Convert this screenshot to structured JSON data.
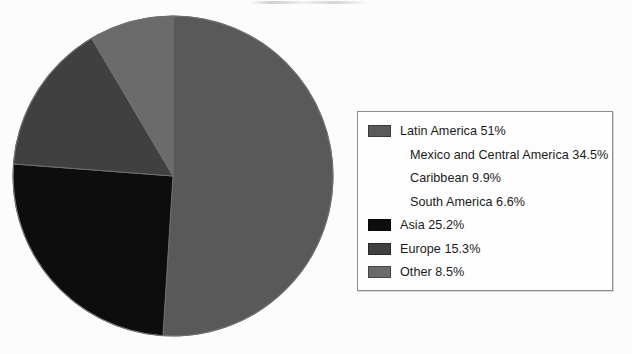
{
  "chart_data": {
    "type": "pie",
    "title": "",
    "subtitle": "",
    "xlabel": "",
    "ylabel": "",
    "legend_position": "right",
    "grid": false,
    "start_angle_deg": 0,
    "direction": "clockwise",
    "categories": [
      "Latin America",
      "Asia",
      "Europe",
      "Other"
    ],
    "values": [
      51,
      25.2,
      15.3,
      8.5
    ],
    "value_unit": "%",
    "colors": [
      "#595959",
      "#0d0d0d",
      "#404040",
      "#6b6b6b"
    ],
    "slices": [
      {
        "label": "Latin America",
        "value": 51,
        "display": "51%",
        "color": "#595959"
      },
      {
        "label": "Asia",
        "value": 25.2,
        "display": "25.2%",
        "color": "#0d0d0d"
      },
      {
        "label": "Europe",
        "value": 15.3,
        "display": "15.3%",
        "color": "#404040"
      },
      {
        "label": "Other",
        "value": 8.5,
        "display": "8.5%",
        "color": "#6b6b6b"
      }
    ],
    "subcategories": [
      {
        "parent": "Latin America",
        "label": "Mexico and Central America",
        "value": 34.5,
        "display": "34.5%"
      },
      {
        "parent": "Latin America",
        "label": "Caribbean",
        "value": 9.9,
        "display": "9.9%"
      },
      {
        "parent": "Latin America",
        "label": "South America",
        "value": 6.6,
        "display": "6.6%"
      }
    ],
    "annotations": []
  },
  "legend": {
    "rows": [
      {
        "text": "Latin America 51%",
        "swatch": "#595959",
        "has_swatch": true,
        "indent": false
      },
      {
        "text": "Mexico and Central America 34.5%",
        "swatch": "",
        "has_swatch": false,
        "indent": true
      },
      {
        "text": "Caribbean 9.9%",
        "swatch": "",
        "has_swatch": false,
        "indent": true
      },
      {
        "text": "South America 6.6%",
        "swatch": "",
        "has_swatch": false,
        "indent": true
      },
      {
        "text": "Asia 25.2%",
        "swatch": "#0d0d0d",
        "has_swatch": true,
        "indent": false
      },
      {
        "text": "Europe 15.3%",
        "swatch": "#404040",
        "has_swatch": true,
        "indent": false
      },
      {
        "text": "Other 8.5%",
        "swatch": "#6b6b6b",
        "has_swatch": true,
        "indent": false
      }
    ]
  },
  "pie_geometry": {
    "center_x": 173,
    "center_y": 176,
    "radius": 160,
    "outline_color": "#6f6f6f"
  }
}
